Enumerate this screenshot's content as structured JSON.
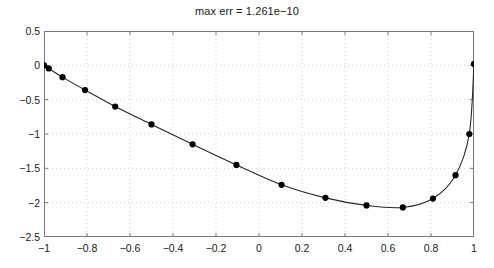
{
  "figure": {
    "title": "max err = 1.261e−10",
    "background_color": "#ffffff",
    "axis_color": "#7a7a7a",
    "grid_color": "#c8c8c8",
    "line_color": "#262626",
    "marker_color": "#000000"
  },
  "axes": {
    "x_ticks": [
      "−1",
      "−0.8",
      "−0.6",
      "−0.4",
      "−0.2",
      "0",
      "0.2",
      "0.4",
      "0.6",
      "0.8",
      "1"
    ],
    "y_ticks": [
      "0.5",
      "0",
      "−0.5",
      "−1",
      "−1.5",
      "−2",
      "−2.5"
    ],
    "xlim": [
      -1,
      1
    ],
    "ylim": [
      -2.5,
      0.5
    ],
    "grid": true
  },
  "chart_data": {
    "type": "line",
    "title": "max err = 1.261e−10",
    "xlabel": "",
    "ylabel": "",
    "xlim": [
      -1,
      1
    ],
    "ylim": [
      -2.5,
      0.5
    ],
    "x_ticks": [
      -1,
      -0.8,
      -0.6,
      -0.4,
      -0.2,
      0,
      0.2,
      0.4,
      0.6,
      0.8,
      1
    ],
    "y_ticks": [
      0.5,
      0,
      -0.5,
      -1,
      -1.5,
      -2,
      -2.5
    ],
    "grid": true,
    "legend": null,
    "series": [
      {
        "name": "interpolant",
        "style": "solid line with filled circle markers",
        "marker": "o",
        "x": [
          -1.0,
          -0.978,
          -0.914,
          -0.809,
          -0.669,
          -0.5,
          -0.309,
          -0.105,
          0.105,
          0.309,
          0.5,
          0.669,
          0.809,
          0.914,
          0.978,
          1.0
        ],
        "y": [
          0.0,
          -0.045,
          -0.172,
          -0.36,
          -0.6,
          -0.86,
          -1.15,
          -1.45,
          -1.74,
          -1.93,
          -2.04,
          -2.07,
          -1.94,
          -1.6,
          -1.0,
          0.02
        ]
      }
    ],
    "curve_note": "smooth curve through all 16 Chebyshev-spaced nodes; minimum near x = 0.58, y = -2.08"
  }
}
